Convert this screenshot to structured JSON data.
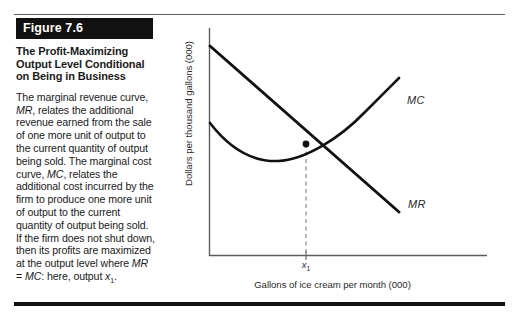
{
  "figure": {
    "tag": "Figure 7.6",
    "title": "The Profit-Maximizing Output Level Conditional on Being in Business",
    "body": "The marginal revenue curve, MR, relates the additional revenue earned from the sale of one more unit of output to the current quantity of output being sold. The marginal cost curve, MC, relates the additional cost incurred by the firm to produce one more unit of output to the current quantity of output being sold. If the firm does not shut down, then its profits are maximized at the output level where MR = MC: here, output x₁."
  },
  "chart_data": {
    "type": "line",
    "title": "",
    "xlabel": "Gallons of ice cream per month (000)",
    "ylabel": "Dollars per thousand gallons (000)",
    "grid": false,
    "legend_position": "inline-curve-labels",
    "xlim": [
      0,
      100
    ],
    "ylim": [
      0,
      100
    ],
    "xticks": [
      "x₁"
    ],
    "xtick_positions": [
      58
    ],
    "yticks": [],
    "annotations": [
      {
        "name": "intersection-point",
        "x": 58,
        "y": 50,
        "label": "MR = MC"
      },
      {
        "name": "dashed-dropline",
        "from": [
          58,
          50
        ],
        "to": [
          58,
          0
        ]
      }
    ],
    "series": [
      {
        "name": "MR",
        "label": "MR",
        "type": "line",
        "color": "#111111",
        "points": [
          [
            0,
            91
          ],
          [
            58,
            50
          ],
          [
            88,
            26
          ]
        ]
      },
      {
        "name": "MC",
        "label": "MC",
        "type": "curve",
        "color": "#111111",
        "points": [
          [
            0,
            56
          ],
          [
            14,
            43
          ],
          [
            30,
            38
          ],
          [
            44,
            41
          ],
          [
            58,
            50
          ],
          [
            72,
            62
          ],
          [
            86,
            76
          ]
        ]
      }
    ]
  },
  "axis_labels": {
    "y_title": "Dollars per thousand gallons (000)",
    "x_title": "Gallons of ice cream per month (000)",
    "x_tick": "x",
    "x_tick_sub": "1"
  },
  "curve_labels": {
    "mc": "MC",
    "mr": "MR"
  }
}
